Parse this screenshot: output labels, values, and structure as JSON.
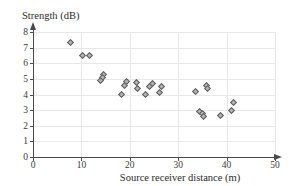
{
  "chart_data": {
    "type": "scatter",
    "title": "",
    "xlabel": "Source receiver distance (m)",
    "ylabel": "Strength (dB)",
    "xlim": [
      0,
      50
    ],
    "ylim": [
      0,
      8
    ],
    "xticks": [
      0,
      10,
      20,
      30,
      40,
      50
    ],
    "yticks": [
      0,
      1,
      2,
      3,
      4,
      5,
      6,
      7,
      8
    ],
    "xtick_labels": [
      "0",
      "10",
      "20",
      "30",
      "40",
      "50"
    ],
    "ytick_labels": [
      "0",
      "1",
      "2",
      "3",
      "4",
      "5",
      "6",
      "7",
      "8"
    ],
    "grid": true,
    "legend": "none",
    "marker": "diamond",
    "marker_color": "#b6b6b6",
    "marker_edge_color": "#5d5d5d",
    "axis_color": "#4a4a4a",
    "grid_color": "#e8e8e8",
    "points": [
      {
        "x": 7.7,
        "y": 7.3
      },
      {
        "x": 10.2,
        "y": 6.5
      },
      {
        "x": 11.6,
        "y": 6.5
      },
      {
        "x": 14.6,
        "y": 5.3
      },
      {
        "x": 14.3,
        "y": 5.1
      },
      {
        "x": 14.0,
        "y": 4.9
      },
      {
        "x": 18.2,
        "y": 4.0
      },
      {
        "x": 19.0,
        "y": 4.6
      },
      {
        "x": 19.4,
        "y": 4.85
      },
      {
        "x": 21.4,
        "y": 4.75
      },
      {
        "x": 21.5,
        "y": 4.4
      },
      {
        "x": 23.2,
        "y": 4.0
      },
      {
        "x": 24.0,
        "y": 4.5
      },
      {
        "x": 24.6,
        "y": 4.7
      },
      {
        "x": 26.2,
        "y": 4.1
      },
      {
        "x": 26.5,
        "y": 4.5
      },
      {
        "x": 33.5,
        "y": 4.2
      },
      {
        "x": 35.9,
        "y": 4.6
      },
      {
        "x": 36.1,
        "y": 4.4
      },
      {
        "x": 34.4,
        "y": 2.9
      },
      {
        "x": 35.1,
        "y": 2.8
      },
      {
        "x": 35.3,
        "y": 2.6
      },
      {
        "x": 38.8,
        "y": 2.65
      },
      {
        "x": 41.0,
        "y": 3.0
      },
      {
        "x": 41.4,
        "y": 3.5
      }
    ]
  }
}
